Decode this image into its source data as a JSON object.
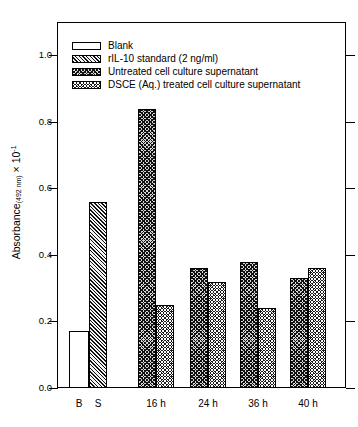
{
  "chart_data": {
    "type": "bar",
    "title": "",
    "xlabel": "",
    "ylabel": "Absorbance(492 nm) × 10⁻¹",
    "ylabel_parts": {
      "main": "Absorbance",
      "sub": "(492 nm)",
      "times": " × 10",
      "sup": "-1"
    },
    "ylim": [
      0.0,
      1.1
    ],
    "yticks": [
      "0.0",
      "0.2",
      "0.4",
      "0.6",
      "0.8",
      "1.0"
    ],
    "ytick_values": [
      0.0,
      0.2,
      0.4,
      0.6,
      0.8,
      1.0
    ],
    "grid": false,
    "legend_position": "top-left",
    "categories": [
      "B",
      "S",
      "16 h",
      "24 h",
      "36 h",
      "40 h"
    ],
    "series": [
      {
        "name": "Blank",
        "pattern": "blank",
        "values": [
          0.17,
          null,
          null,
          null,
          null,
          null
        ]
      },
      {
        "name": "rIL-10 standard (2 ng/ml)",
        "pattern": "diagonal-hatch",
        "values": [
          null,
          0.56,
          null,
          null,
          null,
          null
        ]
      },
      {
        "name": "Untreated cell culture supernatant",
        "pattern": "cross-hatch-light",
        "values": [
          null,
          null,
          0.84,
          0.36,
          0.38,
          0.33
        ]
      },
      {
        "name": "DSCE (Aq.) treated cell culture supernatant",
        "pattern": "cross-hatch-dark",
        "values": [
          null,
          null,
          0.25,
          0.32,
          0.24,
          0.36
        ]
      }
    ],
    "bars": [
      {
        "label": "B",
        "series": "Blank",
        "pattern": "blank",
        "value": 0.17,
        "x": 69,
        "width": 20
      },
      {
        "label": "S",
        "series": "rIL-10 standard (2 ng/ml)",
        "pattern": "diag",
        "value": 0.56,
        "x": 89,
        "width": 18
      },
      {
        "label": "16 h",
        "series": "Untreated cell culture supernatant",
        "pattern": "cross",
        "value": 0.84,
        "x": 138,
        "width": 18
      },
      {
        "label": "16 h",
        "series": "DSCE (Aq.) treated cell culture supernatant",
        "pattern": "dark",
        "value": 0.25,
        "x": 156,
        "width": 18
      },
      {
        "label": "24 h",
        "series": "Untreated cell culture supernatant",
        "pattern": "cross",
        "value": 0.36,
        "x": 190,
        "width": 18
      },
      {
        "label": "24 h",
        "series": "DSCE (Aq.) treated cell culture supernatant",
        "pattern": "dark",
        "value": 0.32,
        "x": 208,
        "width": 18
      },
      {
        "label": "36 h",
        "series": "Untreated cell culture supernatant",
        "pattern": "cross",
        "value": 0.38,
        "x": 240,
        "width": 18
      },
      {
        "label": "36 h",
        "series": "DSCE (Aq.) treated cell culture supernatant",
        "pattern": "dark",
        "value": 0.24,
        "x": 258,
        "width": 18
      },
      {
        "label": "40 h",
        "series": "Untreated cell culture supernatant",
        "pattern": "cross",
        "value": 0.33,
        "x": 290,
        "width": 18
      },
      {
        "label": "40 h",
        "series": "DSCE (Aq.) treated cell culture supernatant",
        "pattern": "dark",
        "value": 0.36,
        "x": 308,
        "width": 18
      }
    ],
    "xtick_labels": [
      {
        "text": "B",
        "center": 79
      },
      {
        "text": "S",
        "center": 98
      },
      {
        "text": "16 h",
        "center": 156
      },
      {
        "text": "24 h",
        "center": 208
      },
      {
        "text": "36 h",
        "center": 258
      },
      {
        "text": "40 h",
        "center": 308
      }
    ]
  },
  "legend": {
    "items": [
      {
        "label": "Blank",
        "pattern": "blank"
      },
      {
        "label": "rIL-10 standard (2 ng/ml)",
        "pattern": "diag"
      },
      {
        "label": "Untreated cell culture supernatant",
        "pattern": "cross"
      },
      {
        "label": "DSCE (Aq.) treated cell culture supernatant",
        "pattern": "dark"
      }
    ]
  },
  "colors": {
    "axis": "#000000",
    "background": "#ffffff",
    "bar_light": "#e8e8e8",
    "bar_dark": "#1a1a1a"
  }
}
